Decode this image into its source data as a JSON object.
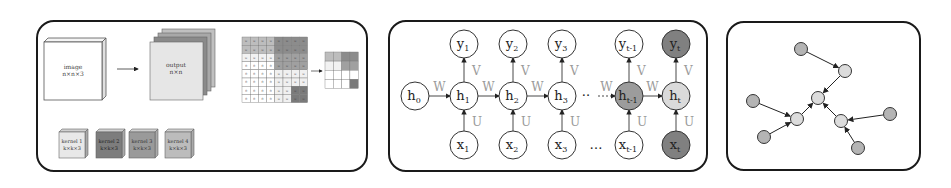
{
  "panels": [
    {
      "id": "cnn",
      "title": "Convolutional layer",
      "image_block": {
        "label": "image",
        "dims": "n×n×3"
      },
      "output_block": {
        "label": "output",
        "dims": "n×n"
      },
      "kernels": [
        {
          "label": "kernel 1",
          "dims": "k×k×3",
          "color": "#e8e8e8"
        },
        {
          "label": "kernel 2",
          "dims": "k×k×3",
          "color": "#7d7d7d"
        },
        {
          "label": "kernel 3",
          "dims": "k×k×3",
          "color": "#9a9a9a"
        },
        {
          "label": "kernel 4",
          "dims": "k×k×3",
          "color": "#bcbcbc"
        }
      ],
      "output_layers_colors": [
        "#e6e6e6",
        "#8a8a8a",
        "#a8a8a8",
        "#c0c0c0"
      ],
      "matrix_cell_values": {
        "weight": "w",
        "zero": "0"
      }
    },
    {
      "id": "rnn",
      "title": "Recurrent neural network",
      "hidden": [
        "h",
        "h",
        "h",
        "h",
        "h",
        "h"
      ],
      "hidden_subs": [
        "0",
        "1",
        "2",
        "3",
        "t-1",
        "t"
      ],
      "inputs_subs": [
        "1",
        "2",
        "3",
        "t-1",
        "t"
      ],
      "outputs_subs": [
        "1",
        "2",
        "3",
        "t-1",
        "t"
      ],
      "input_symbol": "x",
      "output_symbol": "y",
      "weights": {
        "recurrent": "W",
        "input": "U",
        "output": "V"
      },
      "ellipsis": "…",
      "colors": {
        "h_t_minus_1": "#9c9c9c",
        "h_t": "#dadada",
        "x_t": "#808080",
        "y_t": "#808080",
        "default": "#ffffff"
      }
    },
    {
      "id": "graph",
      "title": "Graph / tree structure",
      "node_colors": {
        "leaf": "#b4b4b4",
        "internal": "#dcdcdc"
      },
      "nodes": [
        {
          "id": "A",
          "x": 801,
          "y": 49,
          "kind": "leaf"
        },
        {
          "id": "B",
          "x": 845,
          "y": 71,
          "kind": "internal"
        },
        {
          "id": "C",
          "x": 818,
          "y": 98,
          "kind": "internal"
        },
        {
          "id": "D",
          "x": 753,
          "y": 101,
          "kind": "leaf"
        },
        {
          "id": "E",
          "x": 797,
          "y": 119,
          "kind": "internal"
        },
        {
          "id": "F",
          "x": 764,
          "y": 137,
          "kind": "leaf"
        },
        {
          "id": "G",
          "x": 841,
          "y": 121,
          "kind": "internal"
        },
        {
          "id": "H",
          "x": 890,
          "y": 114,
          "kind": "leaf"
        },
        {
          "id": "I",
          "x": 858,
          "y": 148,
          "kind": "leaf"
        }
      ],
      "edges": [
        [
          "A",
          "B"
        ],
        [
          "B",
          "C"
        ],
        [
          "D",
          "E"
        ],
        [
          "F",
          "E"
        ],
        [
          "E",
          "C"
        ],
        [
          "G",
          "C"
        ],
        [
          "H",
          "G"
        ],
        [
          "I",
          "G"
        ]
      ]
    }
  ]
}
